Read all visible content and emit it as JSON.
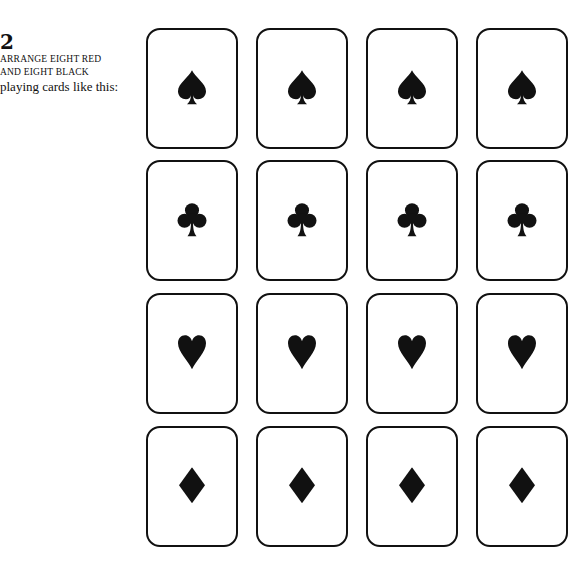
{
  "caption": {
    "step_number": "2",
    "line1": "ARRANGE EIGHT RED",
    "line2": "AND EIGHT BLACK",
    "line3": "playing cards like this:"
  },
  "colors": {
    "ink": "#111111",
    "paper": "#ffffff"
  },
  "grid": {
    "columns_x": [
      146,
      256,
      366,
      476
    ],
    "rows_y": [
      28,
      160,
      293,
      426
    ],
    "rows": [
      {
        "suit": "spade",
        "icon": "spade-icon",
        "cards": [
          "spade",
          "spade",
          "spade",
          "spade"
        ]
      },
      {
        "suit": "club",
        "icon": "club-icon",
        "cards": [
          "club",
          "club",
          "club",
          "club"
        ]
      },
      {
        "suit": "heart",
        "icon": "heart-icon",
        "cards": [
          "heart",
          "heart",
          "heart",
          "heart"
        ]
      },
      {
        "suit": "diamond",
        "icon": "diamond-icon",
        "cards": [
          "diamond",
          "diamond",
          "diamond",
          "diamond"
        ]
      }
    ]
  }
}
